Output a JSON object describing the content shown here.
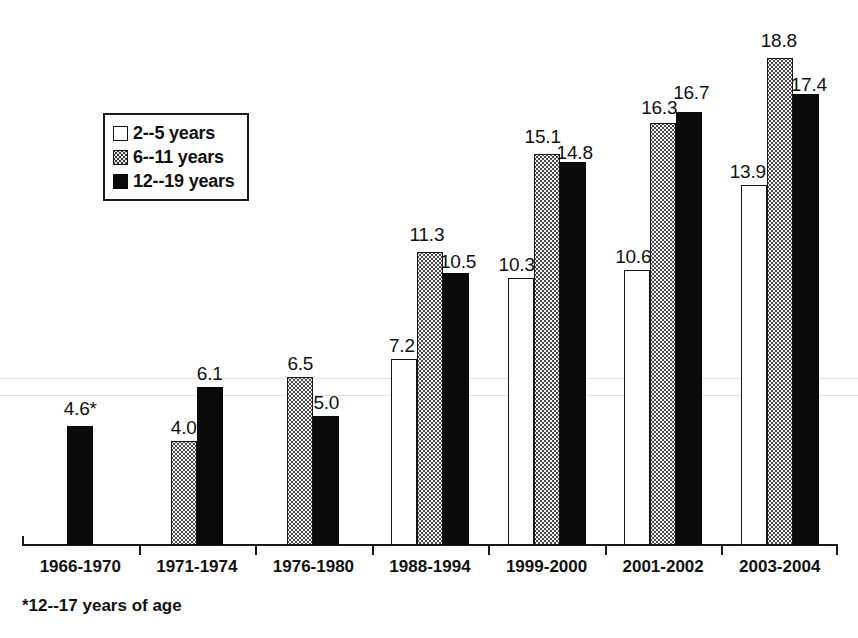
{
  "chart_data": {
    "type": "bar",
    "title": "",
    "subtitle": "",
    "xlabel": "",
    "ylabel": "",
    "grid": false,
    "legend_position": "upper-left-inside",
    "axis": {
      "y_min": 0,
      "y_max": 19,
      "y_axis_visible": false,
      "x_axis_visible": true
    },
    "categories": [
      "1966-1970",
      "1971-1974",
      "1976-1980",
      "1988-1994",
      "1999-2000",
      "2001-2002",
      "2003-2004"
    ],
    "series": [
      {
        "name": "2--5 years",
        "style": "open",
        "values": [
          null,
          null,
          null,
          7.2,
          10.3,
          10.6,
          13.9
        ],
        "labels": [
          "",
          "",
          "",
          "7.2",
          "10.3",
          "10.6",
          "13.9"
        ]
      },
      {
        "name": "6--11 years",
        "style": "hatched",
        "values": [
          null,
          4.0,
          6.5,
          11.3,
          15.1,
          16.3,
          18.8
        ],
        "labels": [
          "",
          "4.0",
          "6.5",
          "11.3",
          "15.1",
          "16.3",
          "18.8"
        ]
      },
      {
        "name": "12--19 years",
        "style": "solid",
        "values": [
          4.6,
          6.1,
          5.0,
          10.5,
          14.8,
          16.7,
          17.4
        ],
        "labels": [
          "4.6*",
          "6.1",
          "5.0",
          "10.5",
          "14.8",
          "16.7",
          "17.4"
        ]
      }
    ],
    "annotations": [
      "*12--17 years of age"
    ]
  },
  "legend": {
    "items": [
      {
        "label": "2--5 years",
        "swatch": "open-square-icon"
      },
      {
        "label": "6--11 years",
        "swatch": "hatched-square-icon"
      },
      {
        "label": "12--19 years",
        "swatch": "filled-square-icon"
      }
    ]
  },
  "footnote": {
    "text": "*12--17 years of age"
  },
  "colors": {
    "ink": "#111111",
    "bar_solid": "#0a0a0a",
    "bar_open_fill": "#ffffff",
    "bar_hatch_fill": "#f2f2f2",
    "background": "#ffffff"
  }
}
